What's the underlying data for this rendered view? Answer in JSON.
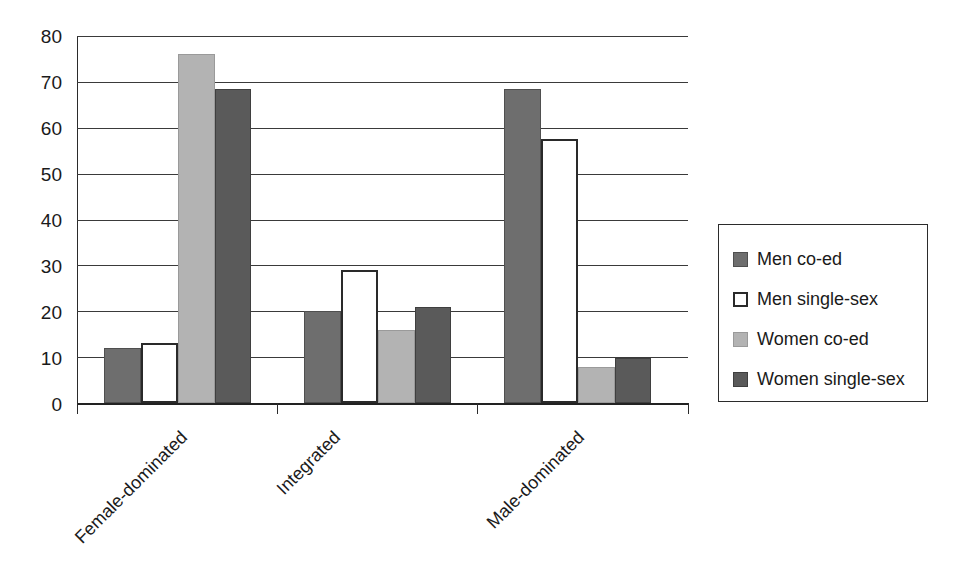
{
  "chart_data": {
    "type": "bar",
    "title": "",
    "subtitle": "",
    "xlabel": "",
    "ylabel": "",
    "categories": [
      "Female-dominated",
      "Integrated",
      "Male-dominated"
    ],
    "series": [
      {
        "name": "Men co-ed",
        "color": "#6e6e6e",
        "values": [
          12,
          20,
          68.5
        ]
      },
      {
        "name": "Men single-sex",
        "color": "#ffffff",
        "values": [
          13,
          29,
          57.5
        ]
      },
      {
        "name": "Women co-ed",
        "color": "#b3b3b3",
        "values": [
          76,
          16,
          7.8
        ]
      },
      {
        "name": "Women single-sex",
        "color": "#5a5a5a",
        "values": [
          68.5,
          21,
          9.8
        ]
      }
    ],
    "ylim": [
      0,
      80
    ],
    "y_ticks": [
      0,
      10,
      20,
      30,
      40,
      50,
      60,
      70,
      80
    ],
    "y_tick_labels": [
      "0",
      "10",
      "20",
      "30",
      "40",
      "50",
      "60",
      "70",
      "80"
    ],
    "grid": true,
    "legend_position": "right",
    "x_tick_label_rotation": -45
  },
  "legend": {
    "items": [
      {
        "label": "Men co-ed",
        "swatch": "men-co-ed"
      },
      {
        "label": "Men single-sex",
        "swatch": "men-single-sex"
      },
      {
        "label": "Women co-ed",
        "swatch": "women-co-ed"
      },
      {
        "label": "Women single-sex",
        "swatch": "women-single-sex"
      }
    ]
  },
  "axis": {
    "y_labels": [
      "80",
      "70",
      "60",
      "50",
      "40",
      "30",
      "20",
      "10",
      "0"
    ],
    "x_labels": [
      "Female-dominated",
      "Integrated",
      "Male-dominated"
    ]
  }
}
